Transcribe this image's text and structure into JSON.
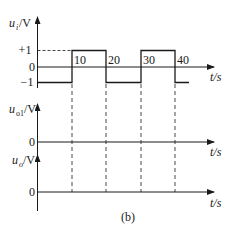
{
  "figure": {
    "caption": "(b)",
    "colors": {
      "line": "#1a1a1a",
      "background": "#ffffff"
    },
    "plots": [
      {
        "id": "ui",
        "ylabel_main": "u",
        "ylabel_sub": "i",
        "ylabel_unit": "/V",
        "xlabel": "t/s",
        "ytick_pos": "+1",
        "ytick_zero": "0",
        "ytick_neg": "−1",
        "xticks": [
          "10",
          "20",
          "30",
          "40"
        ]
      },
      {
        "id": "uo1",
        "ylabel_main": "u",
        "ylabel_sub": "o1",
        "ylabel_unit": "/V",
        "xlabel": "t/s",
        "ytick_zero": "0"
      },
      {
        "id": "uo",
        "ylabel_main": "u",
        "ylabel_sub": "o",
        "ylabel_unit": "/V",
        "xlabel": "t/s",
        "ytick_zero": "0"
      }
    ],
    "waveform_ui": {
      "type": "square",
      "segments": [
        {
          "t_start": 0,
          "t_end": 10,
          "value": -1
        },
        {
          "t_start": 10,
          "t_end": 20,
          "value": 1
        },
        {
          "t_start": 20,
          "t_end": 30,
          "value": -1
        },
        {
          "t_start": 30,
          "t_end": 40,
          "value": 1
        },
        {
          "t_start": 40,
          "t_end": 44,
          "value": -1
        }
      ]
    }
  }
}
